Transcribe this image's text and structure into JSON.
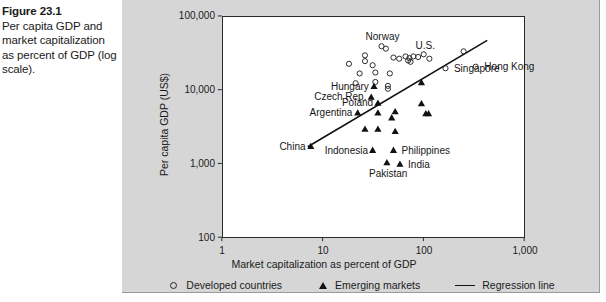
{
  "figure": {
    "number": "Figure 23.1",
    "caption": "Per capita GDP and market capitalization as percent of GDP (log scale)."
  },
  "chart_data": {
    "type": "scatter",
    "title": "Per capita GDP and market capitalization as percent of GDP (log scale)",
    "xlabel": "Market capitalization as percent of GDP",
    "ylabel": "Per capita GDP (US$)",
    "xscale": "log",
    "yscale": "log",
    "xlim": [
      1,
      1000
    ],
    "ylim": [
      100,
      100000
    ],
    "xticks": [
      "1",
      "10",
      "100",
      "1,000"
    ],
    "xtick_values": [
      1,
      10,
      100,
      1000
    ],
    "yticks": [
      "100",
      "1,000",
      "10,000",
      "100,000"
    ],
    "ytick_values": [
      100,
      1000,
      10000,
      100000
    ],
    "grid": false,
    "legend_position": "bottom",
    "legend": [
      {
        "key": "developed",
        "label": "Developed countries",
        "marker": "open-circle"
      },
      {
        "key": "emerging",
        "label": "Emerging markets",
        "marker": "filled-triangle"
      },
      {
        "key": "regression",
        "label": "Regression line",
        "marker": "line"
      }
    ],
    "series": [
      {
        "name": "Developed countries",
        "key": "developed",
        "marker": "open-circle",
        "points": [
          {
            "x": 38,
            "y": 40000,
            "label": "Norway",
            "label_pos": "above"
          },
          {
            "x": 42,
            "y": 37000,
            "label": "",
            "label_pos": ""
          },
          {
            "x": 26,
            "y": 30000,
            "label": "",
            "label_pos": ""
          },
          {
            "x": 26,
            "y": 25000,
            "label": "",
            "label_pos": ""
          },
          {
            "x": 18,
            "y": 23000,
            "label": "",
            "label_pos": ""
          },
          {
            "x": 31,
            "y": 22000,
            "label": "",
            "label_pos": ""
          },
          {
            "x": 50,
            "y": 28000,
            "label": "",
            "label_pos": ""
          },
          {
            "x": 57,
            "y": 27000,
            "label": "",
            "label_pos": ""
          },
          {
            "x": 66,
            "y": 29000,
            "label": "",
            "label_pos": ""
          },
          {
            "x": 72,
            "y": 27500,
            "label": "",
            "label_pos": ""
          },
          {
            "x": 79,
            "y": 29000,
            "label": "",
            "label_pos": ""
          },
          {
            "x": 88,
            "y": 28500,
            "label": "",
            "label_pos": ""
          },
          {
            "x": 100,
            "y": 31000,
            "label": "U.S.",
            "label_pos": "above"
          },
          {
            "x": 114,
            "y": 27000,
            "label": "",
            "label_pos": ""
          },
          {
            "x": 70,
            "y": 25500,
            "label": "",
            "label_pos": ""
          },
          {
            "x": 74,
            "y": 24500,
            "label": "",
            "label_pos": ""
          },
          {
            "x": 23,
            "y": 17000,
            "label": "",
            "label_pos": ""
          },
          {
            "x": 33,
            "y": 17500,
            "label": "",
            "label_pos": ""
          },
          {
            "x": 46,
            "y": 17000,
            "label": "",
            "label_pos": ""
          },
          {
            "x": 21,
            "y": 12500,
            "label": "",
            "label_pos": ""
          },
          {
            "x": 33,
            "y": 13000,
            "label": "",
            "label_pos": ""
          },
          {
            "x": 44,
            "y": 11500,
            "label": "",
            "label_pos": ""
          },
          {
            "x": 44,
            "y": 10500,
            "label": "",
            "label_pos": ""
          },
          {
            "x": 165,
            "y": 20000,
            "label": "Singapore",
            "label_pos": "right"
          },
          {
            "x": 250,
            "y": 34000,
            "label": "",
            "label_pos": ""
          },
          {
            "x": 330,
            "y": 21000,
            "label": "Hong Kong",
            "label_pos": "right"
          }
        ]
      },
      {
        "name": "Emerging markets",
        "key": "emerging",
        "marker": "filled-triangle",
        "points": [
          {
            "x": 32,
            "y": 11500,
            "label": "Hungary",
            "label_pos": "left"
          },
          {
            "x": 30,
            "y": 8200,
            "label": "Czech Rep.",
            "label_pos": "left"
          },
          {
            "x": 35,
            "y": 6800,
            "label": "Poland",
            "label_pos": "left"
          },
          {
            "x": 22,
            "y": 5000,
            "label": "Argentina",
            "label_pos": "left"
          },
          {
            "x": 35,
            "y": 5000,
            "label": "",
            "label_pos": ""
          },
          {
            "x": 52,
            "y": 5200,
            "label": "",
            "label_pos": ""
          },
          {
            "x": 48,
            "y": 4300,
            "label": "",
            "label_pos": ""
          },
          {
            "x": 95,
            "y": 13000,
            "label": "",
            "label_pos": ""
          },
          {
            "x": 95,
            "y": 6700,
            "label": "",
            "label_pos": ""
          },
          {
            "x": 105,
            "y": 4900,
            "label": "",
            "label_pos": ""
          },
          {
            "x": 112,
            "y": 4900,
            "label": "",
            "label_pos": ""
          },
          {
            "x": 26,
            "y": 3000,
            "label": "",
            "label_pos": ""
          },
          {
            "x": 35,
            "y": 3000,
            "label": "",
            "label_pos": ""
          },
          {
            "x": 52,
            "y": 2800,
            "label": "",
            "label_pos": ""
          },
          {
            "x": 7.5,
            "y": 1750,
            "label": "China",
            "label_pos": "left"
          },
          {
            "x": 31,
            "y": 1550,
            "label": "Indonesia",
            "label_pos": "left"
          },
          {
            "x": 50,
            "y": 1550,
            "label": "Philippines",
            "label_pos": "right"
          },
          {
            "x": 43,
            "y": 1050,
            "label": "Pakistan",
            "label_pos": "below"
          },
          {
            "x": 58,
            "y": 1000,
            "label": "India",
            "label_pos": "right"
          }
        ]
      }
    ],
    "regression_line": {
      "label": "Regression line",
      "x_start": 7.0,
      "y_start": 1700,
      "x_end": 430,
      "y_end": 48000
    }
  }
}
